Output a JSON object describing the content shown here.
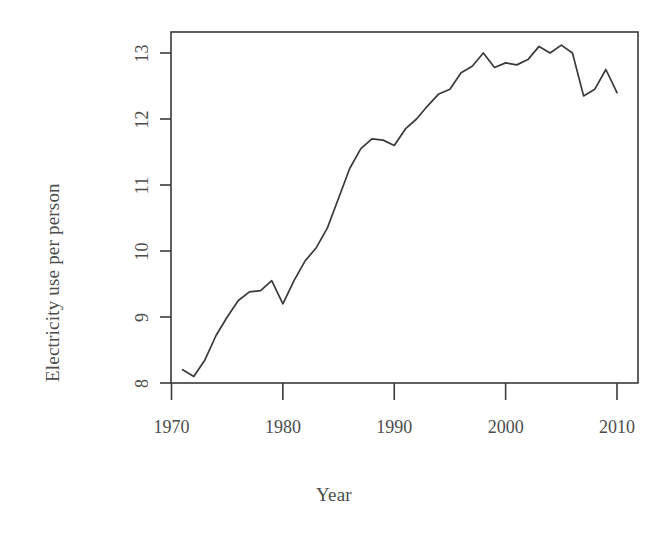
{
  "chart_data": {
    "type": "line",
    "title": "",
    "subtitle": "",
    "xlabel": "Year",
    "ylabel": "Electricity use per person",
    "xlim": [
      1971,
      2010
    ],
    "ylim": [
      8.0,
      13.3
    ],
    "xticks": [
      1970,
      1980,
      1990,
      2000,
      2010
    ],
    "xtick_labels": [
      "1970",
      "1980",
      "1990",
      "2000",
      "2010"
    ],
    "yticks": [
      8,
      9,
      10,
      11,
      12,
      13
    ],
    "ytick_labels": [
      "8",
      "9",
      "10",
      "11",
      "12",
      "13"
    ],
    "grid": false,
    "legend": null,
    "legend_position": "none",
    "line_color": "#3a3a3a",
    "line_width": 1.6,
    "frame": true,
    "x": [
      1971,
      1972,
      1973,
      1974,
      1975,
      1976,
      1977,
      1978,
      1979,
      1980,
      1981,
      1982,
      1983,
      1984,
      1985,
      1986,
      1987,
      1988,
      1989,
      1990,
      1991,
      1992,
      1993,
      1994,
      1995,
      1996,
      1997,
      1998,
      1999,
      2000,
      2001,
      2002,
      2003,
      2004,
      2005,
      2006,
      2007,
      2008,
      2009,
      2010
    ],
    "y": [
      8.2,
      8.1,
      8.35,
      8.72,
      9.0,
      9.25,
      9.38,
      9.4,
      9.55,
      9.2,
      9.55,
      9.85,
      10.05,
      10.35,
      10.8,
      11.25,
      11.55,
      11.7,
      11.68,
      11.6,
      11.85,
      12.0,
      12.2,
      12.38,
      12.45,
      12.7,
      12.8,
      13.0,
      12.78,
      12.85,
      12.82,
      12.9,
      13.1,
      13.0,
      13.12,
      13.0,
      12.35,
      12.45,
      12.75,
      12.4
    ],
    "series": [
      {
        "name": "Electricity use per person",
        "values": [
          8.2,
          8.1,
          8.35,
          8.72,
          9.0,
          9.25,
          9.38,
          9.4,
          9.55,
          9.2,
          9.55,
          9.85,
          10.05,
          10.35,
          10.8,
          11.25,
          11.55,
          11.7,
          11.68,
          11.6,
          11.85,
          12.0,
          12.2,
          12.38,
          12.45,
          12.7,
          12.8,
          13.0,
          12.78,
          12.85,
          12.82,
          12.9,
          13.1,
          13.0,
          13.12,
          13.0,
          12.35,
          12.45,
          12.75,
          12.4
        ]
      }
    ],
    "annotations": []
  },
  "axes": {
    "x_title": "Year",
    "y_title": "Electricity use per person"
  }
}
